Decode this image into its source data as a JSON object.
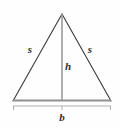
{
  "figure": {
    "name": "isosceles-triangle-with-height-and-base",
    "background_color": "#fefefe",
    "outline_color": "#3a3a3a",
    "height_line_color": "#9a9a9a",
    "base_line_color": "#8f8f8f",
    "bracket_color": "#b0b0b0",
    "label_color": "#2e2e2e",
    "labels": {
      "side_left": "s",
      "side_right": "s",
      "height": "h",
      "base": "b"
    },
    "geometry": {
      "apex": [
        62,
        14
      ],
      "base_left": [
        13,
        101
      ],
      "base_right": [
        111,
        101
      ],
      "height_foot": [
        62,
        101
      ],
      "bracket_y": 106,
      "bracket_left_x": 13,
      "bracket_right_x": 111,
      "bracket_center_x": 62
    }
  }
}
